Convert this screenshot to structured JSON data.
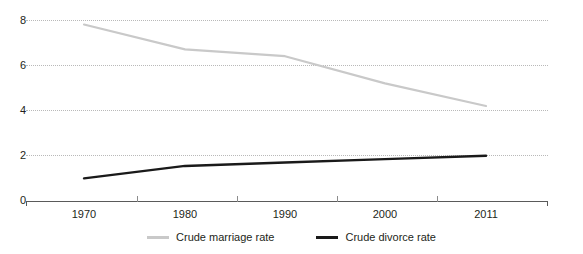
{
  "chart_data": {
    "type": "line",
    "title": "",
    "xlabel": "",
    "ylabel": "",
    "x": [
      1970,
      1980,
      1990,
      2000,
      2011
    ],
    "categories": [
      "1970",
      "1980",
      "1990",
      "2000",
      "2011"
    ],
    "series": [
      {
        "name": "Crude marriage rate",
        "color": "#c9c9c9",
        "values": [
          7.8,
          6.7,
          6.4,
          5.2,
          4.2
        ]
      },
      {
        "name": "Crude divorce rate",
        "color": "#1a1a1a",
        "values": [
          1.0,
          1.55,
          1.7,
          1.85,
          2.0
        ]
      }
    ],
    "ylim": [
      0,
      8
    ],
    "yticks": [
      0,
      2,
      4,
      6,
      8
    ],
    "ytick_labels": [
      "0",
      "2",
      "4",
      "6",
      "8"
    ],
    "grid": "horizontal-dotted",
    "legend_position": "bottom"
  },
  "yaxis": {
    "ticks": [
      {
        "label": "8",
        "value": 8
      },
      {
        "label": "6",
        "value": 6
      },
      {
        "label": "4",
        "value": 4
      },
      {
        "label": "2",
        "value": 2
      },
      {
        "label": "0",
        "value": 0
      }
    ]
  },
  "xaxis": {
    "labels": [
      "1970",
      "1980",
      "1990",
      "2000",
      "2011"
    ]
  },
  "legend": {
    "items": [
      {
        "label": "Crude marriage rate",
        "color": "#c9c9c9"
      },
      {
        "label": "Crude divorce rate",
        "color": "#1a1a1a"
      }
    ]
  }
}
